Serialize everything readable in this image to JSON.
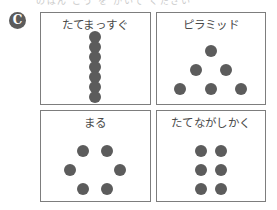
{
  "page": {
    "section_marker": "C",
    "scan_artifact_text": "のばん ごう を かいて ください",
    "dot_color": "#5c5c5c",
    "panel_border_color": "#7d7d7d",
    "title_color": "#4a4a4a",
    "background": "#ffffff"
  },
  "panels": [
    {
      "id": "panel-tate-massugu",
      "title": "たてまっすぐ",
      "pattern": "vertical-line",
      "dot_count": 7,
      "dot_diameter": 12,
      "dots": [
        {
          "x": 50,
          "y": 27
        },
        {
          "x": 50,
          "y": 38
        },
        {
          "x": 50,
          "y": 49
        },
        {
          "x": 50,
          "y": 60
        },
        {
          "x": 50,
          "y": 71
        },
        {
          "x": 50,
          "y": 82
        },
        {
          "x": 50,
          "y": 93
        }
      ]
    },
    {
      "id": "panel-piramiddo",
      "title": "ピラミッド",
      "pattern": "pyramid",
      "dot_count": 6,
      "dot_diameter": 12,
      "dots": [
        {
          "x": 50,
          "y": 42
        },
        {
          "x": 36,
          "y": 63
        },
        {
          "x": 64,
          "y": 63
        },
        {
          "x": 22,
          "y": 84
        },
        {
          "x": 50,
          "y": 84
        },
        {
          "x": 78,
          "y": 84
        }
      ]
    },
    {
      "id": "panel-maru",
      "title": "まる",
      "pattern": "circle",
      "dot_count": 6,
      "dot_diameter": 12,
      "dots": [
        {
          "x": 39,
          "y": 45
        },
        {
          "x": 61,
          "y": 45
        },
        {
          "x": 27,
          "y": 66
        },
        {
          "x": 73,
          "y": 66
        },
        {
          "x": 39,
          "y": 87
        },
        {
          "x": 61,
          "y": 87
        }
      ]
    },
    {
      "id": "panel-tatenaga-shikaku",
      "title": "たてながしかく",
      "pattern": "vertical-rectangle",
      "dot_count": 6,
      "dot_diameter": 12,
      "dots": [
        {
          "x": 41,
          "y": 45
        },
        {
          "x": 59,
          "y": 45
        },
        {
          "x": 41,
          "y": 66
        },
        {
          "x": 59,
          "y": 66
        },
        {
          "x": 41,
          "y": 87
        },
        {
          "x": 59,
          "y": 87
        }
      ]
    }
  ]
}
